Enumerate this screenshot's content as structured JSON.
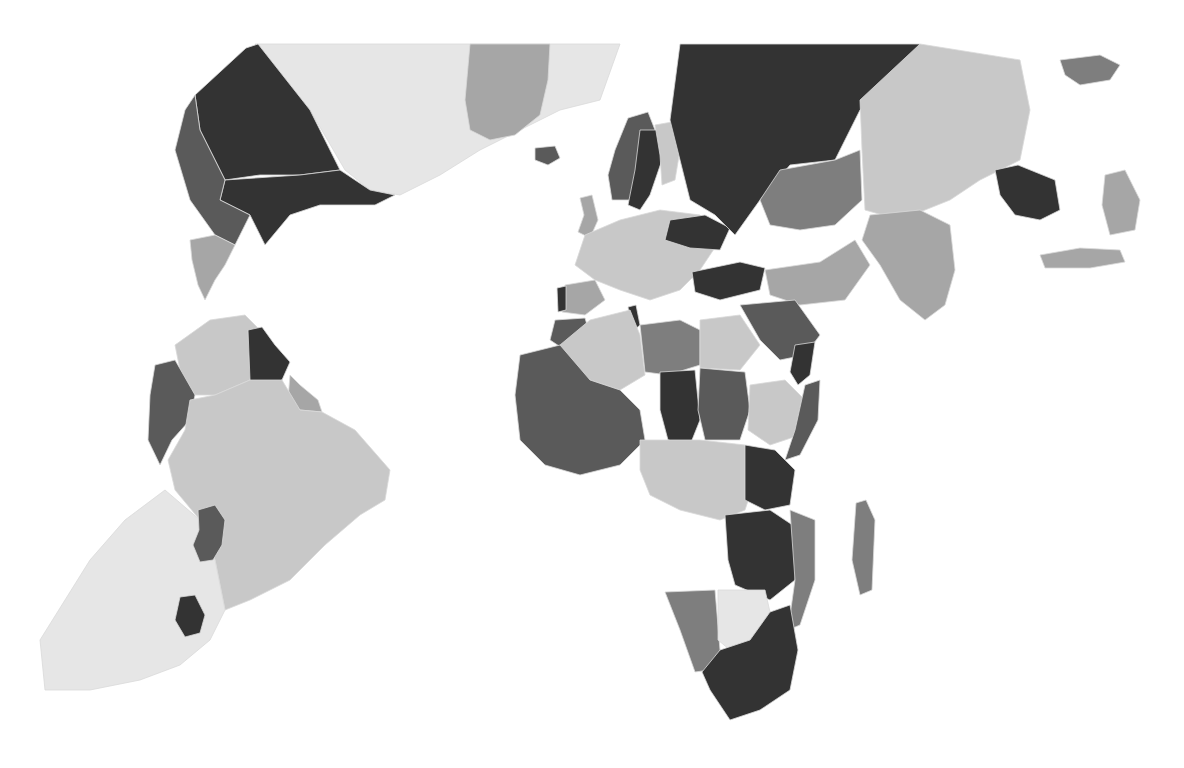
{
  "map": {
    "type": "choropleth",
    "style": "grayscale",
    "shade_levels": {
      "lightest": "#e6e6e6",
      "light": "#c8c8c8",
      "mid": "#a6a6a6",
      "midDark": "#7e7e7e",
      "dark": "#5a5a5a",
      "darkest": "#333333"
    },
    "regions": [
      {
        "id": "north-america-west",
        "name": "Alaska/West (dark)",
        "shade": "darkest"
      },
      {
        "id": "canada",
        "name": "Canada",
        "shade": "lightest"
      },
      {
        "id": "greenland",
        "name": "Greenland",
        "shade": "mid"
      },
      {
        "id": "united-states",
        "name": "United States",
        "shade": "darkest"
      },
      {
        "id": "mexico",
        "name": "Mexico",
        "shade": "dark"
      },
      {
        "id": "central-america",
        "name": "Central America",
        "shade": "mid"
      },
      {
        "id": "colombia",
        "name": "Colombia",
        "shade": "light"
      },
      {
        "id": "venezuela",
        "name": "Venezuela",
        "shade": "darkest"
      },
      {
        "id": "guyana-suriname",
        "name": "Guyana/Suriname",
        "shade": "mid"
      },
      {
        "id": "ecuador-peru",
        "name": "Peru",
        "shade": "dark"
      },
      {
        "id": "brazil",
        "name": "Brazil",
        "shade": "light"
      },
      {
        "id": "argentina-chile",
        "name": "Argentina/Chile",
        "shade": "lightest"
      },
      {
        "id": "paraguay",
        "name": "Paraguay",
        "shade": "dark"
      },
      {
        "id": "uruguay",
        "name": "Uruguay",
        "shade": "darkest"
      },
      {
        "id": "scandinavia-norway",
        "name": "Norway",
        "shade": "dark"
      },
      {
        "id": "sweden",
        "name": "Sweden",
        "shade": "darkest"
      },
      {
        "id": "finland",
        "name": "Finland",
        "shade": "light"
      },
      {
        "id": "russia",
        "name": "Russia",
        "shade": "darkest"
      },
      {
        "id": "kazakhstan",
        "name": "Kazakhstan",
        "shade": "midDark"
      },
      {
        "id": "china",
        "name": "China",
        "shade": "light"
      },
      {
        "id": "india",
        "name": "India",
        "shade": "mid"
      },
      {
        "id": "southeast-asia",
        "name": "Southeast Asia",
        "shade": "darkest"
      },
      {
        "id": "indonesia",
        "name": "Indonesia",
        "shade": "mid"
      },
      {
        "id": "western-europe",
        "name": "Western Europe",
        "shade": "light"
      },
      {
        "id": "ukraine",
        "name": "Ukraine",
        "shade": "darkest"
      },
      {
        "id": "turkey",
        "name": "Turkey",
        "shade": "darkest"
      },
      {
        "id": "iran",
        "name": "Iran",
        "shade": "mid"
      },
      {
        "id": "saudi-arabia",
        "name": "Saudi Arabia",
        "shade": "dark"
      },
      {
        "id": "yemen",
        "name": "Yemen",
        "shade": "darkest"
      },
      {
        "id": "algeria",
        "name": "Algeria",
        "shade": "light"
      },
      {
        "id": "libya",
        "name": "Libya",
        "shade": "midDark"
      },
      {
        "id": "egypt",
        "name": "Egypt",
        "shade": "light"
      },
      {
        "id": "west-africa",
        "name": "West Africa",
        "shade": "dark"
      },
      {
        "id": "chad",
        "name": "Chad",
        "shade": "darkest"
      },
      {
        "id": "sudan",
        "name": "Sudan",
        "shade": "dark"
      },
      {
        "id": "ethiopia",
        "name": "Ethiopia",
        "shade": "light"
      },
      {
        "id": "somalia",
        "name": "Somalia",
        "shade": "dark"
      },
      {
        "id": "central-africa",
        "name": "Central Africa",
        "shade": "light"
      },
      {
        "id": "tanzania",
        "name": "Tanzania",
        "shade": "darkest"
      },
      {
        "id": "mozambique",
        "name": "Mozambique",
        "shade": "midDark"
      },
      {
        "id": "zambia-zimbabwe",
        "name": "Zambia/Zimbabwe",
        "shade": "darkest"
      },
      {
        "id": "namibia",
        "name": "Namibia",
        "shade": "midDark"
      },
      {
        "id": "botswana",
        "name": "Botswana",
        "shade": "lightest"
      },
      {
        "id": "south-africa",
        "name": "South Africa",
        "shade": "darkest"
      },
      {
        "id": "madagascar",
        "name": "Madagascar",
        "shade": "midDark"
      },
      {
        "id": "iceland",
        "name": "Iceland",
        "shade": "dark"
      },
      {
        "id": "uk",
        "name": "United Kingdom",
        "shade": "mid"
      },
      {
        "id": "iberia",
        "name": "Spain",
        "shade": "mid"
      },
      {
        "id": "portugal",
        "name": "Portugal",
        "shade": "darkest"
      },
      {
        "id": "morocco",
        "name": "Morocco",
        "shade": "dark"
      },
      {
        "id": "tunisia",
        "name": "Tunisia",
        "shade": "darkest"
      },
      {
        "id": "japan-east",
        "name": "Japan region",
        "shade": "mid"
      },
      {
        "id": "australia-region",
        "name": "Pacific islands",
        "shade": "midDark"
      }
    ]
  }
}
